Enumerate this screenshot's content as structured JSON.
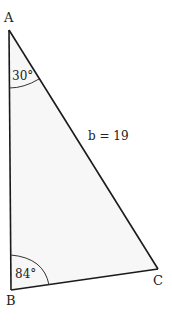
{
  "diagram": {
    "type": "triangle",
    "vertices": {
      "A": {
        "label": "A",
        "x": 9,
        "y": 30
      },
      "B": {
        "label": "B",
        "x": 11,
        "y": 290
      },
      "C": {
        "label": "C",
        "x": 158,
        "y": 269
      }
    },
    "angles": {
      "A": {
        "label": "30°",
        "value": 30
      },
      "B": {
        "label": "84°",
        "value": 84
      }
    },
    "sides": {
      "b": {
        "label": "b = 19",
        "name": "b",
        "value": 19
      }
    },
    "colors": {
      "stroke": "#1a1a1a",
      "fill": "#f7f7f7",
      "text": "#222222"
    }
  }
}
